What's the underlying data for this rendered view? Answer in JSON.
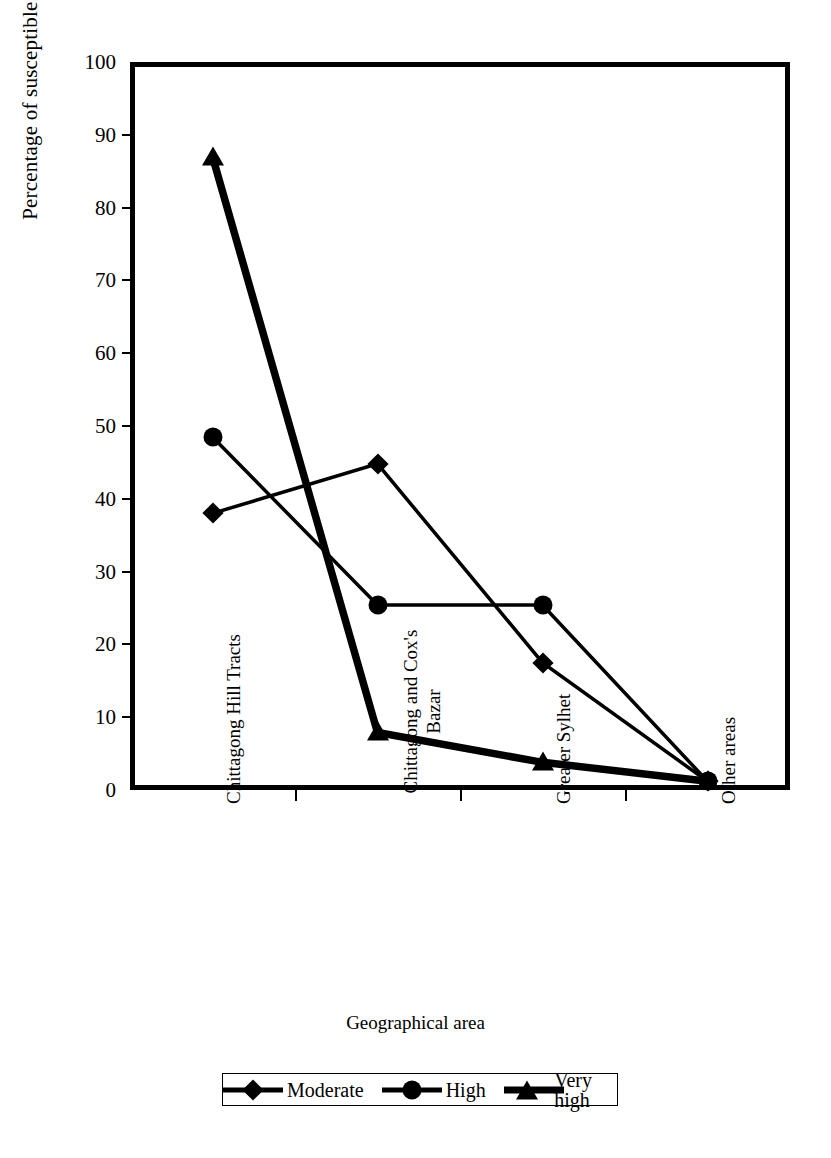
{
  "chart_data": {
    "type": "line",
    "title": "",
    "xlabel": "Geographical area",
    "ylabel": "Percentage of susceptible area",
    "ylim": [
      0,
      100
    ],
    "ytick_step": 10,
    "yticks": [
      100,
      90,
      80,
      70,
      60,
      50,
      40,
      30,
      20,
      10,
      0
    ],
    "grid": false,
    "legend_position": "bottom",
    "categories": [
      "Chittagong Hill Tracts",
      "Chittagong and Cox's Bazar",
      "Greater Sylhet",
      "Other areas"
    ],
    "series": [
      {
        "name": "Moderate",
        "marker": "diamond",
        "values": [
          38.0,
          44.8,
          17.5,
          1.2
        ]
      },
      {
        "name": "High",
        "marker": "circle",
        "values": [
          48.5,
          25.4,
          25.4,
          1.2
        ]
      },
      {
        "name": "Very high",
        "marker": "triangle",
        "values": [
          87.0,
          7.9,
          3.8,
          1.2
        ]
      }
    ]
  },
  "axis": {
    "y_title": "Percentage of susceptible area",
    "x_title": "Geographical area",
    "y_tick_labels": [
      "100",
      "90",
      "80",
      "70",
      "60",
      "50",
      "40",
      "30",
      "20",
      "10",
      "0"
    ],
    "x_tick_labels": [
      {
        "line1": "Chittagong Hill Tracts",
        "line2": ""
      },
      {
        "line1": "Chittagong and Cox's",
        "line2": "Bazar"
      },
      {
        "line1": "Greater Sylhet",
        "line2": ""
      },
      {
        "line1": "Other areas",
        "line2": ""
      }
    ]
  },
  "legend": {
    "items": [
      {
        "label": "Moderate",
        "marker": "diamond-marker"
      },
      {
        "label": "High",
        "marker": "circle-marker"
      },
      {
        "label": "Very high",
        "marker": "triangle-marker"
      }
    ]
  },
  "style": {
    "line_color": "#000000",
    "marker_color": "#000000",
    "frame_color": "#000000",
    "background": "#ffffff"
  }
}
